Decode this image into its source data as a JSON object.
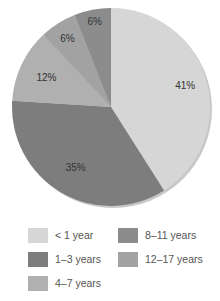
{
  "chart_data": {
    "type": "pie",
    "title": "",
    "categories": [
      "< 1 year",
      "1–3 years",
      "4–7 years",
      "12–17 years",
      "8–11 years"
    ],
    "values": [
      41,
      35,
      12,
      6,
      6
    ],
    "labels": [
      "41%",
      "35%",
      "12%",
      "6%",
      "6%"
    ],
    "colors": [
      "#d6d6d6",
      "#7d7d7d",
      "#b0b0b0",
      "#a2a2a2",
      "#8c8c8c"
    ],
    "start_angle": "12 o'clock",
    "direction": "clockwise",
    "legend_position": "bottom"
  },
  "legend": {
    "items": [
      {
        "label": "< 1 year",
        "color": "#d6d6d6"
      },
      {
        "label": "8–11 years",
        "color": "#8c8c8c"
      },
      {
        "label": "1–3 years",
        "color": "#7d7d7d"
      },
      {
        "label": "12–17 years",
        "color": "#a2a2a2"
      },
      {
        "label": "4–7 years",
        "color": "#b0b0b0"
      }
    ]
  }
}
